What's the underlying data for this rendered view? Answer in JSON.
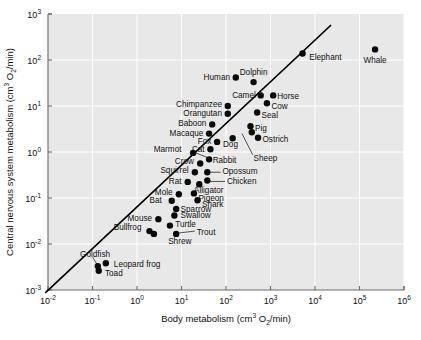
{
  "chart_data": {
    "type": "scatter",
    "title": "",
    "xlabel": "Body metabolism (cm3 O2/min)",
    "ylabel": "Central nervous system metabolism (cm3 O2/min)",
    "xlabel_parts": {
      "base": "Body metabolism (cm",
      "exp1": "3",
      "mid": " O",
      "sub": "2",
      "tail": "/min)"
    },
    "ylabel_parts": {
      "base": "Central nervous system metabolism (cm",
      "exp1": "3",
      "mid": " O",
      "sub": "2",
      "tail": "/min)"
    },
    "xscale": "log",
    "yscale": "log",
    "xlim": [
      -2,
      6
    ],
    "ylim": [
      -3,
      3
    ],
    "grid": true,
    "legend": "none",
    "xticks": [
      {
        "exp": "-2",
        "label": "10-2"
      },
      {
        "exp": "-1",
        "label": "10-1"
      },
      {
        "exp": "0",
        "label": "100"
      },
      {
        "exp": "1",
        "label": "101"
      },
      {
        "exp": "2",
        "label": "102"
      },
      {
        "exp": "3",
        "label": "103"
      },
      {
        "exp": "4",
        "label": "104"
      },
      {
        "exp": "5",
        "label": "105"
      },
      {
        "exp": "6",
        "label": "106"
      }
    ],
    "yticks": [
      {
        "exp": "3",
        "label": "103"
      },
      {
        "exp": "2",
        "label": "102"
      },
      {
        "exp": "1",
        "label": "101"
      },
      {
        "exp": "0",
        "label": "100"
      },
      {
        "exp": "-1",
        "label": "10-1"
      },
      {
        "exp": "-2",
        "label": "10-2"
      },
      {
        "exp": "-3",
        "label": "10-3"
      }
    ],
    "fit_line": {
      "x0": -2.05,
      "y0": -3.05,
      "x1": 4.35,
      "y1": 2.75
    },
    "points": [
      {
        "name": "Whale",
        "x": 5.35,
        "y": 2.23,
        "lx": 5.35,
        "ly": 2.0,
        "anchor": "middle"
      },
      {
        "name": "Elephant",
        "x": 3.72,
        "y": 2.14,
        "lx": 3.87,
        "ly": 2.07,
        "anchor": "start"
      },
      {
        "name": "Dolphin",
        "x": 2.62,
        "y": 1.52,
        "lx": 2.62,
        "ly": 1.73,
        "anchor": "middle"
      },
      {
        "name": "Human",
        "x": 2.22,
        "y": 1.62,
        "lx": 2.09,
        "ly": 1.62,
        "anchor": "end"
      },
      {
        "name": "Camel",
        "x": 2.78,
        "y": 1.23,
        "lx": 2.67,
        "ly": 1.25,
        "anchor": "end"
      },
      {
        "name": "Horse",
        "x": 3.06,
        "y": 1.23,
        "lx": 3.15,
        "ly": 1.21,
        "anchor": "start"
      },
      {
        "name": "Cow",
        "x": 2.92,
        "y": 1.06,
        "lx": 3.02,
        "ly": 1.0,
        "anchor": "start"
      },
      {
        "name": "Seal",
        "x": 2.7,
        "y": 0.86,
        "lx": 2.8,
        "ly": 0.8,
        "anchor": "start"
      },
      {
        "name": "Chimpanzee",
        "x": 2.04,
        "y": 1.0,
        "lx": 1.91,
        "ly": 1.04,
        "anchor": "end"
      },
      {
        "name": "Orangutan",
        "x": 2.04,
        "y": 0.83,
        "lx": 1.91,
        "ly": 0.85,
        "anchor": "end"
      },
      {
        "name": "Baboon",
        "x": 1.69,
        "y": 0.6,
        "lx": 1.56,
        "ly": 0.62,
        "anchor": "end"
      },
      {
        "name": "Macaque",
        "x": 1.62,
        "y": 0.4,
        "lx": 1.49,
        "ly": 0.42,
        "anchor": "end"
      },
      {
        "name": "Pig",
        "x": 2.55,
        "y": 0.56,
        "lx": 2.65,
        "ly": 0.53,
        "anchor": "start"
      },
      {
        "name": "Ostrich",
        "x": 2.72,
        "y": 0.31,
        "lx": 2.82,
        "ly": 0.28,
        "anchor": "start"
      },
      {
        "name": "Dog",
        "x": 2.15,
        "y": 0.3,
        "lx": 2.1,
        "ly": 0.18,
        "anchor": "middle"
      },
      {
        "name": "Fox",
        "x": 1.8,
        "y": 0.22,
        "lx": 1.67,
        "ly": 0.24,
        "anchor": "end"
      },
      {
        "name": "Cat",
        "x": 1.65,
        "y": 0.06,
        "lx": 1.52,
        "ly": 0.07,
        "anchor": "end"
      },
      {
        "name": "Marmot",
        "x": 1.26,
        "y": -0.02,
        "lx": 1.0,
        "ly": 0.06,
        "anchor": "end"
      },
      {
        "name": "Sheep",
        "x": 2.58,
        "y": 0.43,
        "lx": 2.62,
        "ly": -0.12,
        "anchor": "start"
      },
      {
        "name": "Rabbit",
        "x": 1.62,
        "y": -0.16,
        "lx": 1.7,
        "ly": -0.18,
        "anchor": "start"
      },
      {
        "name": "Crow",
        "x": 1.42,
        "y": -0.25,
        "lx": 1.28,
        "ly": -0.2,
        "anchor": "end"
      },
      {
        "name": "Squirrel",
        "x": 1.3,
        "y": -0.44,
        "lx": 1.16,
        "ly": -0.4,
        "anchor": "end"
      },
      {
        "name": "Opossum",
        "x": 1.58,
        "y": -0.44,
        "lx": 1.92,
        "ly": -0.42,
        "anchor": "start"
      },
      {
        "name": "Rat",
        "x": 1.14,
        "y": -0.65,
        "lx": 1.0,
        "ly": -0.62,
        "anchor": "end"
      },
      {
        "name": "Alligator",
        "x": 1.4,
        "y": -0.7,
        "lx": 1.28,
        "ly": -0.82,
        "anchor": "start"
      },
      {
        "name": "Chicken",
        "x": 1.58,
        "y": -0.62,
        "lx": 2.02,
        "ly": -0.63,
        "anchor": "start"
      },
      {
        "name": "Pigeon",
        "x": 1.28,
        "y": -0.9,
        "lx": 1.38,
        "ly": -0.99,
        "anchor": "start"
      },
      {
        "name": "Shark",
        "x": 1.36,
        "y": -1.05,
        "lx": 1.46,
        "ly": -1.14,
        "anchor": "start"
      },
      {
        "name": "Mole",
        "x": 0.94,
        "y": -0.92,
        "lx": 0.8,
        "ly": -0.86,
        "anchor": "end"
      },
      {
        "name": "Bat",
        "x": 0.78,
        "y": -1.06,
        "lx": 0.56,
        "ly": -1.04,
        "anchor": "end"
      },
      {
        "name": "Sparrow",
        "x": 0.88,
        "y": -1.24,
        "lx": 0.98,
        "ly": -1.23,
        "anchor": "start"
      },
      {
        "name": "Swallow",
        "x": 0.84,
        "y": -1.38,
        "lx": 0.98,
        "ly": -1.38,
        "anchor": "start"
      },
      {
        "name": "Mouse",
        "x": 0.48,
        "y": -1.46,
        "lx": 0.34,
        "ly": -1.43,
        "anchor": "end"
      },
      {
        "name": "Turtle",
        "x": 0.74,
        "y": -1.6,
        "lx": 0.86,
        "ly": -1.57,
        "anchor": "start"
      },
      {
        "name": "Trout",
        "x": 0.88,
        "y": -1.78,
        "lx": 1.34,
        "ly": -1.73,
        "anchor": "start"
      },
      {
        "name": "Shrew",
        "x": 0.38,
        "y": -1.78,
        "lx": 0.7,
        "ly": -1.93,
        "anchor": "start"
      },
      {
        "name": "Bullfrog",
        "x": 0.28,
        "y": -1.72,
        "lx": 0.1,
        "ly": -1.64,
        "anchor": "end"
      },
      {
        "name": "Goldfish",
        "x": -0.88,
        "y": -2.48,
        "lx": -1.28,
        "ly": -2.22,
        "anchor": "start"
      },
      {
        "name": "Leopard frog",
        "x": -0.7,
        "y": -2.42,
        "lx": -0.52,
        "ly": -2.44,
        "anchor": "start"
      },
      {
        "name": "Toad",
        "x": -0.86,
        "y": -2.58,
        "lx": -0.72,
        "ly": -2.64,
        "anchor": "start"
      }
    ],
    "leaders": [
      {
        "x0": 1.22,
        "y0": 0.02,
        "x1": 1.58,
        "y1": -0.12
      },
      {
        "x0": 2.6,
        "y0": -0.06,
        "x1": 2.36,
        "y1": 0.4
      },
      {
        "x0": 1.88,
        "y0": -0.44,
        "x1": 1.62,
        "y1": -0.44
      },
      {
        "x0": 1.98,
        "y0": -0.64,
        "x1": 1.62,
        "y1": -0.64
      },
      {
        "x0": 1.3,
        "y0": -1.72,
        "x1": 0.94,
        "y1": -1.76
      },
      {
        "x0": -1.0,
        "y0": -2.28,
        "x1": -0.9,
        "y1": -2.44
      },
      {
        "x0": 1.3,
        "y0": -0.8,
        "x1": 1.4,
        "y1": -0.7
      }
    ]
  }
}
